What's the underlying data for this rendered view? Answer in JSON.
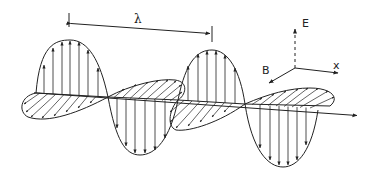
{
  "diagram": {
    "wavelength_label": "λ",
    "axes": {
      "e_label": "E",
      "b_label": "B",
      "x_label": "x"
    },
    "colors": {
      "stroke": "#222222",
      "background": "#ffffff"
    },
    "components": [
      {
        "name": "E-field",
        "orientation": "vertical",
        "style": "vertical arrows"
      },
      {
        "name": "B-field",
        "orientation": "horizontal (perspective)",
        "style": "hatched arrows"
      }
    ]
  }
}
